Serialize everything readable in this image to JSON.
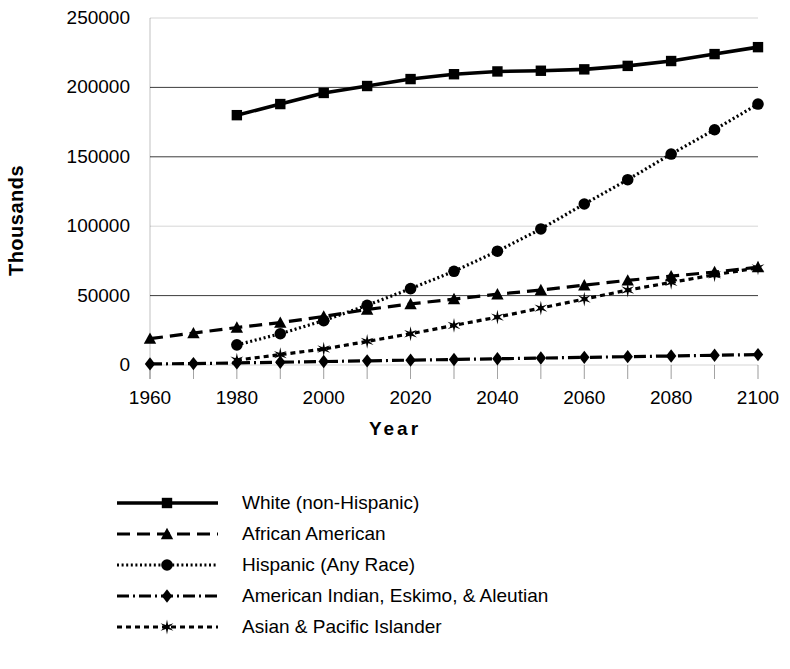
{
  "chart_data": {
    "type": "line",
    "title": "",
    "xlabel": "Year",
    "ylabel": "Thousands",
    "xlim": [
      1960,
      2100
    ],
    "ylim": [
      0,
      250000
    ],
    "xticks": [
      1960,
      1980,
      2000,
      2020,
      2040,
      2060,
      2080,
      2100
    ],
    "xtick_labels": [
      "1960",
      "1980",
      "2000",
      "2020",
      "2040",
      "2060",
      "2080",
      "2100"
    ],
    "xminor_step": 10,
    "yticks": [
      0,
      50000,
      100000,
      150000,
      200000,
      250000
    ],
    "ytick_labels": [
      "0",
      "50000",
      "100000",
      "150000",
      "200000",
      "250000"
    ],
    "grid": "horizontal",
    "legend_position": "below",
    "series": [
      {
        "name": "White (non-Hispanic)",
        "marker": "square",
        "line_style": "solid",
        "color": "#000000",
        "x": [
          1980,
          1990,
          2000,
          2010,
          2020,
          2030,
          2040,
          2050,
          2060,
          2070,
          2080,
          2090,
          2100
        ],
        "values": [
          180000,
          188000,
          196000,
          201000,
          206000,
          209500,
          211500,
          212000,
          213000,
          215500,
          219000,
          224000,
          229000
        ]
      },
      {
        "name": "African American",
        "marker": "triangle",
        "line_style": "dashed",
        "color": "#000000",
        "x": [
          1960,
          1970,
          1980,
          1990,
          2000,
          2010,
          2020,
          2030,
          2040,
          2050,
          2060,
          2070,
          2080,
          2090,
          2100
        ],
        "values": [
          19000,
          23000,
          27000,
          30500,
          35000,
          40000,
          44000,
          47500,
          51000,
          54000,
          57500,
          61000,
          64000,
          67000,
          70500
        ]
      },
      {
        "name": "Hispanic (Any Race)",
        "marker": "circle",
        "line_style": "dotted",
        "color": "#000000",
        "x": [
          1980,
          1990,
          2000,
          2010,
          2020,
          2030,
          2040,
          2050,
          2060,
          2070,
          2080,
          2090,
          2100
        ],
        "values": [
          14500,
          22500,
          32000,
          43000,
          55000,
          67500,
          82000,
          98000,
          116000,
          133500,
          152000,
          169500,
          188000
        ]
      },
      {
        "name": "American Indian, Eskimo, & Aleutian",
        "marker": "diamond",
        "line_style": "dash-dot",
        "color": "#000000",
        "x": [
          1960,
          1970,
          1980,
          1990,
          2000,
          2010,
          2020,
          2030,
          2040,
          2050,
          2060,
          2070,
          2080,
          2090,
          2100
        ],
        "values": [
          800,
          1000,
          1500,
          2000,
          2500,
          3000,
          3500,
          4000,
          4500,
          5000,
          5500,
          6000,
          6500,
          7000,
          7500
        ]
      },
      {
        "name": "Asian & Pacific Islander",
        "marker": "star",
        "line_style": "dotted-dash",
        "color": "#000000",
        "x": [
          1980,
          1990,
          2000,
          2010,
          2020,
          2030,
          2040,
          2050,
          2060,
          2070,
          2080,
          2090,
          2100
        ],
        "values": [
          3500,
          7500,
          11500,
          17000,
          22500,
          28500,
          34500,
          41000,
          47500,
          54000,
          59500,
          65000,
          70000
        ]
      }
    ]
  },
  "legend": {
    "items": [
      {
        "label": "White (non-Hispanic)",
        "marker": "square",
        "style": "solid"
      },
      {
        "label": "African American",
        "marker": "triangle",
        "style": "dashed"
      },
      {
        "label": "Hispanic (Any Race)",
        "marker": "circle",
        "style": "dotted"
      },
      {
        "label": "American Indian, Eskimo, & Aleutian",
        "marker": "diamond",
        "style": "dash-dot"
      },
      {
        "label": "Asian & Pacific Islander",
        "marker": "star",
        "style": "dotted-dash"
      }
    ]
  }
}
